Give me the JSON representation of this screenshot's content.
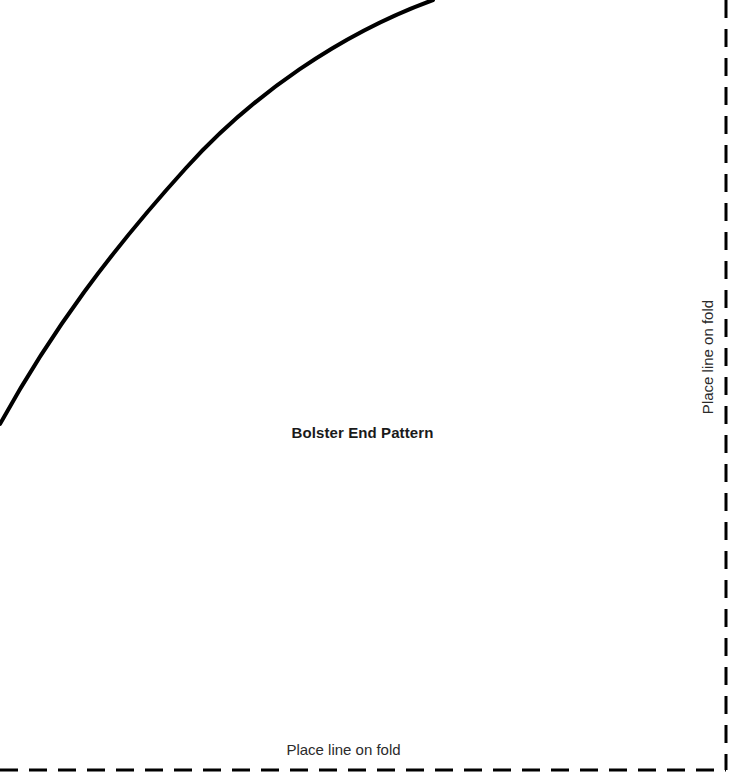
{
  "sheet": {
    "width": 739,
    "height": 779,
    "background_color": "#ffffff",
    "title": "Bolster End Pattern"
  },
  "fold_lines": {
    "right": {
      "label": "Place line on fold",
      "orientation": "vertical",
      "x": 726,
      "y_start": 0,
      "y_end": 770,
      "color": "#000000",
      "stroke_width": 3,
      "dash": [
        18,
        11
      ],
      "label_x": 707,
      "label_y": 357,
      "label_rotation_deg": -90
    },
    "bottom": {
      "label": "Place line on fold",
      "orientation": "horizontal",
      "y": 770,
      "x_start": 0,
      "x_end": 726,
      "color": "#000000",
      "stroke_width": 3,
      "dash": [
        18,
        11
      ],
      "label_x": 343,
      "label_y": 752,
      "label_rotation_deg": 0
    }
  },
  "curve": {
    "name": "bolster-end-arc",
    "shape": "quarter-ellipse",
    "color": "#000000",
    "stroke_width": 4,
    "start": {
      "x": 0,
      "y": 424
    },
    "end": {
      "x": 433,
      "y": 0
    },
    "sampled_points": [
      {
        "x": 0,
        "y": 424
      },
      {
        "x": 60,
        "y": 320
      },
      {
        "x": 125,
        "y": 245
      },
      {
        "x": 200,
        "y": 148
      },
      {
        "x": 300,
        "y": 63
      },
      {
        "x": 390,
        "y": 22
      },
      {
        "x": 433,
        "y": 0
      }
    ],
    "path_d": "M 0 424 C 52 330 110 252 186 168 C 252 95 340 34 433 0"
  }
}
